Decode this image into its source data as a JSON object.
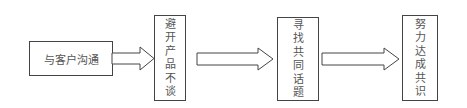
{
  "diagram": {
    "type": "flowchart",
    "direction": "left-to-right",
    "steps": [
      {
        "label": "与客户沟通",
        "orientation": "horizontal"
      },
      {
        "label": "避开产品不谈",
        "orientation": "vertical"
      },
      {
        "label": "寻找共同话题",
        "orientation": "vertical"
      },
      {
        "label": "努力达成共识",
        "orientation": "vertical"
      }
    ],
    "connections": [
      {
        "from": 0,
        "to": 1,
        "style": "hollow-block-arrow"
      },
      {
        "from": 1,
        "to": 2,
        "style": "hollow-block-arrow"
      },
      {
        "from": 2,
        "to": 3,
        "style": "hollow-block-arrow"
      }
    ]
  }
}
